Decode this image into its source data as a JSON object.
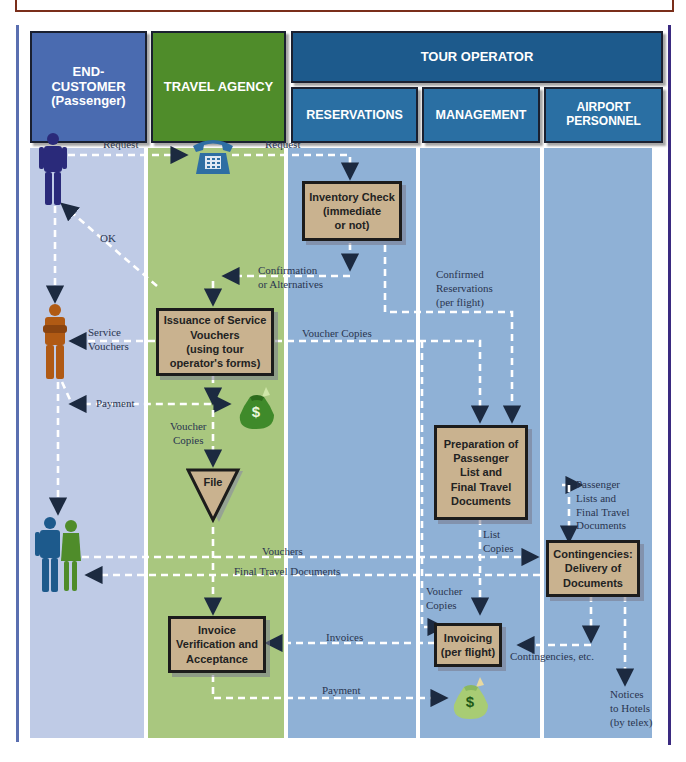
{
  "headers": {
    "end_customer": "END-\nCUSTOMER\n(Passenger)",
    "travel_agency": "TRAVEL AGENCY",
    "tour_operator": "TOUR OPERATOR",
    "reservations": "RESERVATIONS",
    "management": "MANAGEMENT",
    "airport_personnel": "AIRPORT\nPERSONNEL"
  },
  "colors": {
    "end_customer": "#4a6bb0",
    "travel_agency": "#4f8c2a",
    "tour_operator": "#1d5a8c",
    "sub_lane": "#2a6fa3",
    "lane_customer": "#bfcbe6",
    "lane_agency": "#a9c77f",
    "lane_operator": "#8fb1d6",
    "process_box": "#c9b28f"
  },
  "process_boxes": {
    "inventory_check": "Inventory Check\n(immediate\nor not)",
    "issuance": "Issuance of Service\nVouchers\n(using tour\noperator's forms)",
    "file": "File",
    "preparation": "Preparation of\nPassenger\nList and\nFinal Travel\nDocuments",
    "contingencies": "Contingencies:\nDelivery of\nDocuments",
    "invoice_verification": "Invoice\nVerification and\nAcceptance",
    "invoicing": "Invoicing\n(per flight)"
  },
  "flow_labels": {
    "request_1": "Request",
    "request_2": "Request",
    "ok": "OK",
    "confirmation": "Confirmation\nor Alternatives",
    "confirmed_reservations": "Confirmed\nReservations\n(per flight)",
    "service_vouchers": "Service\nVouchers",
    "voucher_copies_1": "Voucher Copies",
    "payment_1": "Payment",
    "voucher_copies_2": "Voucher\nCopies",
    "passenger_lists": "Passenger\nLists and\nFinal Travel\nDocuments",
    "list_copies": "List\nCopies",
    "vouchers": "Vouchers",
    "final_travel_documents": "Final Travel Documents",
    "voucher_copies_3": "Voucher\nCopies",
    "invoices": "Invoices",
    "contingencies_etc": "Contingencies, etc.",
    "payment_2": "Payment",
    "notices": "Notices\nto Hotels\n(by telex)"
  },
  "icons": {
    "passenger_request": "person-icon",
    "passenger_vouchers": "person-arms-crossed-icon",
    "passengers_couple": "couple-icon",
    "telephone": "telephone-icon",
    "money_bag_1": "money-bag-icon",
    "money_bag_2": "money-bag-icon"
  }
}
